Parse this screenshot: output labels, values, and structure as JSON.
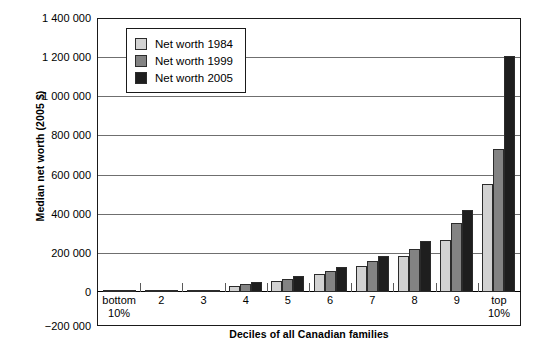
{
  "chart_data": {
    "type": "bar",
    "title": "",
    "xlabel": "Deciles of all Canadian families",
    "ylabel": "Median net worth (2005 $)",
    "ylim": [
      -200000,
      1400000
    ],
    "ytick_labels": [
      "1 400 000",
      "1 200 000",
      "1 000 000",
      "800 000",
      "600 000",
      "400 000",
      "200 000",
      "0",
      "−200 000"
    ],
    "ytick_values": [
      1400000,
      1200000,
      1000000,
      800000,
      600000,
      400000,
      200000,
      0,
      -200000
    ],
    "grid": true,
    "legend_position": "upper-left-inside",
    "categories": [
      "bottom 10%",
      "2",
      "3",
      "4",
      "5",
      "6",
      "7",
      "8",
      "9",
      "top 10%"
    ],
    "category_lines": [
      [
        "bottom",
        "10%"
      ],
      [
        "2",
        ""
      ],
      [
        "3",
        ""
      ],
      [
        "4",
        ""
      ],
      [
        "5",
        ""
      ],
      [
        "6",
        ""
      ],
      [
        "7",
        ""
      ],
      [
        "8",
        ""
      ],
      [
        "9",
        ""
      ],
      [
        "top",
        "10%"
      ]
    ],
    "series": [
      {
        "name": "Net worth 1984",
        "color": "#d2d2d2",
        "values": [
          0,
          1000,
          4000,
          32000,
          56000,
          92000,
          135000,
          185000,
          265000,
          550000
        ]
      },
      {
        "name": "Net worth 1999",
        "color": "#838383",
        "values": [
          0,
          1000,
          5000,
          40000,
          66000,
          108000,
          160000,
          222000,
          355000,
          730000
        ]
      },
      {
        "name": "Net worth 2005",
        "color": "#1e1e1e",
        "values": [
          2000,
          2000,
          8000,
          50000,
          80000,
          128000,
          185000,
          262000,
          420000,
          1205000
        ]
      }
    ]
  },
  "legend": {
    "items": [
      {
        "label": "Net worth 1984",
        "swatch": "legend-swatch-1984"
      },
      {
        "label": "Net worth 1999",
        "swatch": "legend-swatch-1999"
      },
      {
        "label": "Net worth 2005",
        "swatch": "legend-swatch-2005"
      }
    ]
  }
}
